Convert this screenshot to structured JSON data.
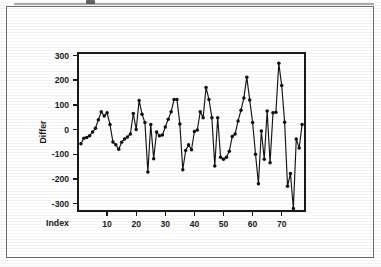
{
  "figure": {
    "background_color": "#ffffff",
    "border_color": "#6d6d6d",
    "ink_color": "#141414"
  },
  "chart_data": {
    "type": "line",
    "title": "",
    "subtitle": "",
    "xlabel": "Index",
    "ylabel": "Differ",
    "xlim": [
      0,
      78
    ],
    "ylim": [
      -330,
      310
    ],
    "xticks": [
      10,
      20,
      30,
      40,
      50,
      60,
      70
    ],
    "xtick_labels": [
      "10",
      "20",
      "30",
      "40",
      "50",
      "60",
      "70"
    ],
    "yticks": [
      300,
      200,
      100,
      0,
      -100,
      -200,
      -300
    ],
    "ytick_labels": [
      "300",
      "200",
      "100",
      "0",
      "-100",
      "-200",
      "-300"
    ],
    "grid": false,
    "legend": false,
    "legend_position": "none",
    "marker": "filled-circle",
    "line_color": "#141414",
    "marker_color": "#101010",
    "x": [
      1,
      2,
      3,
      4,
      5,
      6,
      7,
      8,
      9,
      10,
      11,
      12,
      13,
      14,
      15,
      16,
      17,
      18,
      19,
      20,
      21,
      22,
      23,
      24,
      25,
      26,
      27,
      28,
      29,
      30,
      31,
      32,
      33,
      34,
      35,
      36,
      37,
      38,
      39,
      40,
      41,
      42,
      43,
      44,
      45,
      46,
      47,
      48,
      49,
      50,
      51,
      52,
      53,
      54,
      55,
      56,
      57,
      58,
      59,
      60,
      61,
      62,
      63,
      64,
      65,
      66,
      67,
      68,
      69,
      70,
      71,
      72,
      73,
      74,
      75,
      76,
      77
    ],
    "values": [
      -58,
      -35,
      -32,
      -25,
      -10,
      5,
      40,
      72,
      55,
      68,
      20,
      -50,
      -62,
      -80,
      -52,
      -38,
      -30,
      -18,
      65,
      0,
      118,
      62,
      28,
      -172,
      20,
      -118,
      -10,
      -25,
      -22,
      10,
      42,
      72,
      122,
      122,
      22,
      -163,
      -85,
      -62,
      -82,
      -8,
      -2,
      72,
      48,
      170,
      122,
      48,
      -148,
      48,
      -112,
      -120,
      -112,
      -88,
      -28,
      -18,
      35,
      78,
      128,
      212,
      120,
      28,
      -100,
      -220,
      -6,
      -120,
      75,
      -135,
      68,
      70,
      268,
      178,
      30,
      -230,
      -178,
      -320,
      -38,
      -75,
      20
    ],
    "series": [
      {
        "name": "Differ",
        "values": [
          -58,
          -35,
          -32,
          -25,
          -10,
          5,
          40,
          72,
          55,
          68,
          20,
          -50,
          -62,
          -80,
          -52,
          -38,
          -30,
          -18,
          65,
          0,
          118,
          62,
          28,
          -172,
          20,
          -118,
          -10,
          -25,
          -22,
          10,
          42,
          72,
          122,
          122,
          22,
          -163,
          -85,
          -62,
          -82,
          -8,
          -2,
          72,
          48,
          170,
          122,
          48,
          -148,
          48,
          -112,
          -120,
          -112,
          -88,
          -28,
          -18,
          35,
          78,
          128,
          212,
          120,
          28,
          -100,
          -220,
          -6,
          -120,
          75,
          -135,
          68,
          70,
          268,
          178,
          30,
          -230,
          -178,
          -320,
          -38,
          -75,
          20
        ]
      }
    ]
  }
}
